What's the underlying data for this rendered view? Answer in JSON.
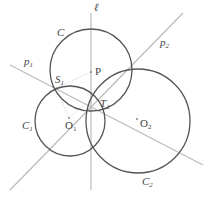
{
  "diagram": {
    "labels": {
      "ell": "ℓ",
      "C": "C",
      "p1": "p",
      "p1_sub": "1",
      "p2": "p",
      "p2_sub": "2",
      "P": "P",
      "S1": "S",
      "S1_sub": "1",
      "T1": "T",
      "T1_sub": "1",
      "C1": "C",
      "C1_sub": "1",
      "O1": "O",
      "O1_sub": "1",
      "O2": "O",
      "O2_sub": "2",
      "C2": "C",
      "C2_sub": "2"
    },
    "colors": {
      "circle": "#555555",
      "line": "#bbbbbb",
      "text": "#444444"
    }
  }
}
